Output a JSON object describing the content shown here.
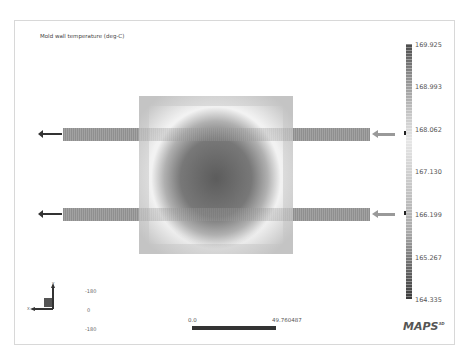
{
  "plot": {
    "title": "Mold wall temperature (deg-C)"
  },
  "legend": {
    "labels": [
      "169.925",
      "168.993",
      "168.062",
      "167.130",
      "166.199",
      "165.267",
      "164.335"
    ],
    "marker_values": [
      "168.062",
      "166.199"
    ],
    "color_scale": "grayscale"
  },
  "axis_triad": {
    "y_label": "Y",
    "x_label": "X",
    "ticks": [
      "-180",
      "0",
      "-180"
    ]
  },
  "scale_bar": {
    "start": "0.0",
    "end": "49.760487"
  },
  "branding": {
    "logo": "MAPS",
    "logo_sup": "3D"
  }
}
